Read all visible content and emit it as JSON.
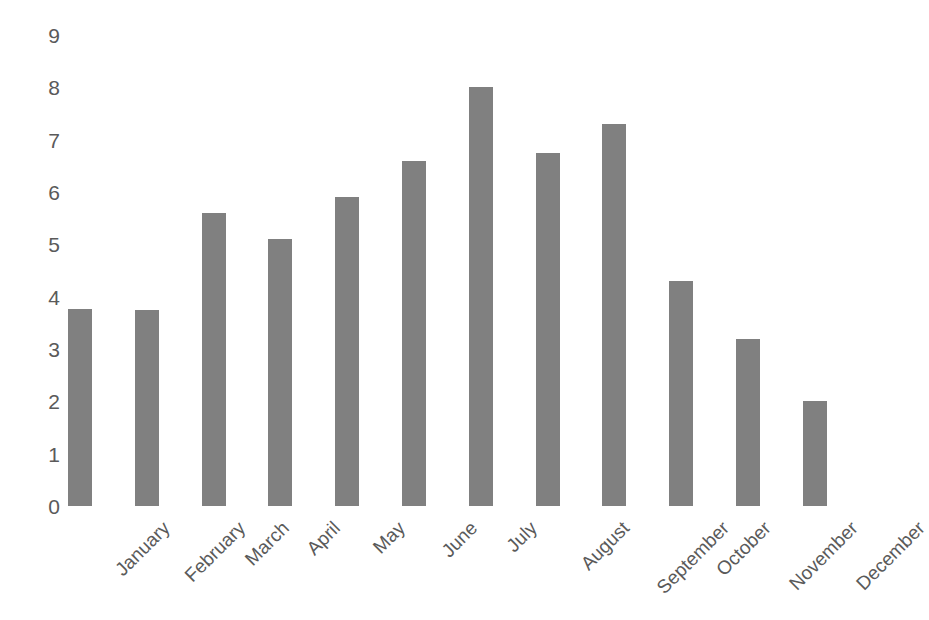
{
  "chart_data": {
    "type": "bar",
    "title": "",
    "subtitle": "",
    "xlabel": "",
    "ylabel": "",
    "categories": [
      "January",
      "February",
      "March",
      "April",
      "May",
      "June",
      "July",
      "August",
      "September",
      "October",
      "November",
      "December"
    ],
    "values": [
      3.77,
      3.75,
      5.6,
      5.1,
      5.9,
      6.6,
      8.0,
      6.75,
      7.3,
      4.3,
      3.2,
      2.0
    ],
    "ylim": [
      0,
      9
    ],
    "ytick_labels": [
      "0",
      "1",
      "2",
      "3",
      "4",
      "5",
      "6",
      "7",
      "8",
      "9"
    ],
    "ytick_values": [
      0,
      1,
      2,
      3,
      4,
      5,
      6,
      7,
      8,
      9
    ],
    "grid": false,
    "legend": false,
    "legend_position": "none",
    "bar_color": "#808080",
    "text_color": "#5a5a5a",
    "background_color": "#ffffff",
    "xtick_rotation_degrees": -45
  }
}
